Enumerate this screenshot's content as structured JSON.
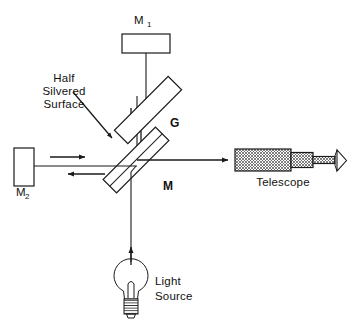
{
  "figure": {
    "type": "optics-diagram",
    "background_color": "#ffffff",
    "line_color": "#1a1a1a"
  },
  "labels": {
    "mirror_1": "M",
    "mirror_1_subscript": "1",
    "mirror_2": "M",
    "mirror_2_subscript": "2",
    "beam_splitter": "M",
    "compensator_plate": "G",
    "half_silvered_line_1": "Half",
    "half_silvered_line_2": "Silvered",
    "half_silvered_line_3": "Surface",
    "telescope": "Telescope",
    "light_source_line_1": "Light",
    "light_source_line_2": "Source"
  },
  "components": [
    {
      "name": "mirror-m1",
      "label": "M1",
      "role": "fixed mirror (top arm)"
    },
    {
      "name": "mirror-m2",
      "label": "M2",
      "role": "movable mirror (left arm)"
    },
    {
      "name": "compensator-plate",
      "label": "G",
      "role": "compensator plate, 45 degrees"
    },
    {
      "name": "beam-splitter",
      "label": "M",
      "role": "half silvered beam splitter, 45 degrees"
    },
    {
      "name": "telescope",
      "label": "Telescope",
      "role": "observing telescope / eyepiece"
    },
    {
      "name": "light-source",
      "label": "Light Source",
      "role": "incandescent bulb source"
    },
    {
      "name": "eye",
      "label": "",
      "role": "observer eye symbol"
    }
  ],
  "beams": [
    {
      "name": "source-to-splitter",
      "direction": "up",
      "arrow": true
    },
    {
      "name": "splitter-to-m1-down",
      "direction": "down",
      "arrow": true
    },
    {
      "name": "m1-to-splitter-up",
      "direction": "up",
      "arrow": true
    },
    {
      "name": "splitter-to-m2",
      "direction": "right",
      "arrow": true
    },
    {
      "name": "m2-to-splitter",
      "direction": "left",
      "arrow": true
    },
    {
      "name": "splitter-to-telescope",
      "direction": "right",
      "arrow": true
    }
  ],
  "annotations": {
    "pointer_from": "Half Silvered Surface label",
    "pointer_to": "beam splitter M"
  }
}
